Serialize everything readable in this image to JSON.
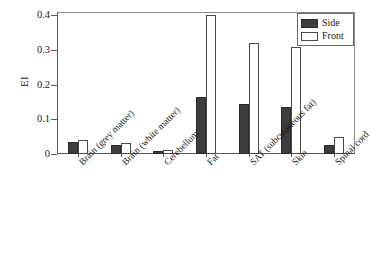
{
  "chart_data": {
    "type": "bar",
    "title": "",
    "xlabel": "",
    "ylabel": "EI",
    "ylim": [
      0,
      0.41
    ],
    "yticks": [
      "0",
      "0.1",
      "0.2",
      "0.3",
      "0.4"
    ],
    "ytick_values": [
      0,
      0.1,
      0.2,
      0.3,
      0.4
    ],
    "grid": false,
    "legend_position": "top-right",
    "categories": [
      "Brain (grey matter)",
      "Brain (white matter)",
      "Cerebellum",
      "Fat",
      "SAT (subcutaneous fat)",
      "Skin",
      "Spinal cord"
    ],
    "series": [
      {
        "name": "Side",
        "color": "#3d3d3d",
        "values": [
          0.035,
          0.026,
          0.009,
          0.165,
          0.143,
          0.135,
          0.026
        ]
      },
      {
        "name": "Front",
        "color": "#ffffff",
        "values": [
          0.041,
          0.031,
          0.012,
          0.4,
          0.32,
          0.31,
          0.048
        ]
      }
    ]
  },
  "legend": {
    "items": [
      {
        "label": "Side"
      },
      {
        "label": "Front"
      }
    ]
  }
}
